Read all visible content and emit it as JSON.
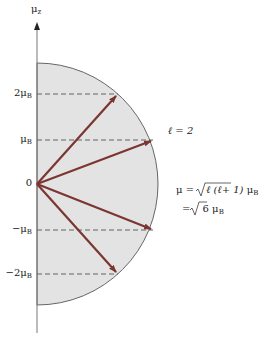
{
  "diagram": {
    "axis_label": {
      "main": "μ",
      "sub": "z"
    },
    "ticks": [
      {
        "main": "2μ",
        "sub": "B",
        "y": 94
      },
      {
        "main": "μ",
        "sub": "B",
        "y": 140
      },
      {
        "main": "0",
        "sub": "",
        "y": 184
      },
      {
        "main": "−μ",
        "sub": "B",
        "y": 230
      },
      {
        "main": "−2μ",
        "sub": "B",
        "y": 274
      }
    ],
    "quantum_number": "ℓ = 2",
    "formula_line1_prefix": "μ = ",
    "formula_line1_radicand": "ℓ (ℓ+ 1)",
    "formula_line1_suffix_main": " μ",
    "formula_line1_suffix_sub": "B",
    "formula_line2_prefix": "= ",
    "formula_line2_radicand": "6",
    "formula_line2_suffix_main": " μ",
    "formula_line2_suffix_sub": "B",
    "colors": {
      "arrow": "#7b3631",
      "fill": "#e3e3e3",
      "outline": "#666666",
      "axis": "#777777",
      "dash": "#555555"
    },
    "geometry": {
      "origin_x": 37,
      "origin_y": 184,
      "radius": 121,
      "arrow_tips": [
        [
          118,
          94
        ],
        [
          153,
          140
        ],
        [
          153,
          230
        ],
        [
          118,
          274
        ]
      ]
    }
  }
}
